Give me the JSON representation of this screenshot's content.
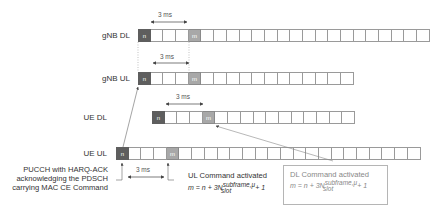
{
  "rows": [
    {
      "id": "gnb-dl",
      "label": "gNB DL",
      "x": 138,
      "y": 29,
      "cells": 23,
      "n_index": 0,
      "m_index": 4
    },
    {
      "id": "gnb-ul",
      "label": "gNB UL",
      "x": 138,
      "y": 72,
      "cells": 17,
      "n_index": 0,
      "m_index": 4
    },
    {
      "id": "ue-dl",
      "label": "UE DL",
      "x": 152,
      "y": 111,
      "cells": 16,
      "n_index": 0,
      "m_index": 4
    },
    {
      "id": "ue-ul",
      "label": "UE UL",
      "x": 116,
      "y": 147,
      "cells": 24,
      "n_index": 0,
      "m_index": 4
    }
  ],
  "cell_labels": {
    "n": "n",
    "m": "m"
  },
  "intervals": [
    {
      "label": "3 ms",
      "row": "gnb-dl"
    },
    {
      "label": "3 ms",
      "row": "gnb-ul"
    },
    {
      "label": "3 ms",
      "row": "ue-dl"
    },
    {
      "label": "3 ms",
      "row": "ue-ul"
    }
  ],
  "annotations": {
    "pucch": {
      "line1": "PUCCH with HARQ-ACK",
      "line2": "acknowledging the PDSCH",
      "line3": "carrying MAC CE Command"
    },
    "ul_command": {
      "title": "UL Command activated",
      "formula_prefix": "m = n + 3N",
      "sup": "subframe,μ",
      "sub": "slot",
      "formula_suffix": " + 1"
    },
    "dl_command": {
      "title": "DL Command activated",
      "formula_prefix": "m = n + 3N",
      "sup": "subframe,μ",
      "sub": "slot",
      "formula_suffix": " + 1"
    }
  },
  "colors": {
    "n_cell": "#5e5e5e",
    "m_cell": "#a8a8a8",
    "grid": "#9a9a9a"
  }
}
